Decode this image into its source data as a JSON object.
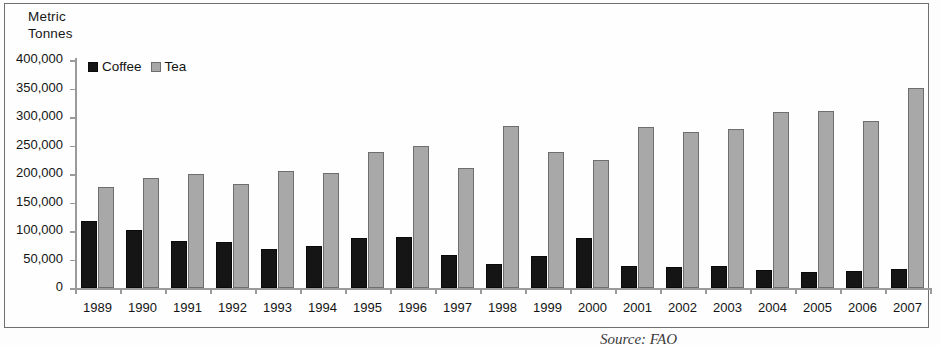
{
  "chart_data": {
    "type": "bar",
    "title": "",
    "axis_title": "Metric\nTonnes",
    "xlabel": "",
    "ylabel": "Metric Tonnes",
    "ylim": [
      0,
      400000
    ],
    "ytick_step": 50000,
    "grid": false,
    "legend_position": "top-left",
    "categories": [
      "1989",
      "1990",
      "1991",
      "1992",
      "1993",
      "1994",
      "1995",
      "1996",
      "1997",
      "1998",
      "1999",
      "2000",
      "2001",
      "2002",
      "2003",
      "2004",
      "2005",
      "2006",
      "2007"
    ],
    "ytick_labels": [
      "400,000",
      "350,000",
      "300,000",
      "250,000",
      "200,000",
      "150,000",
      "100,000",
      "50,000",
      "0"
    ],
    "ytick_values": [
      400000,
      350000,
      300000,
      250000,
      200000,
      150000,
      100000,
      50000,
      0
    ],
    "series": [
      {
        "name": "Coffee",
        "color": "#151515",
        "values": [
          117000,
          102000,
          83000,
          81000,
          69000,
          73000,
          88000,
          89000,
          58000,
          43000,
          56000,
          88000,
          38000,
          37000,
          39000,
          32000,
          28000,
          30000,
          33000
        ]
      },
      {
        "name": "Tea",
        "color": "#a8a8a8",
        "values": [
          178000,
          193000,
          200000,
          183000,
          205000,
          202000,
          238000,
          249000,
          211000,
          285000,
          238000,
          224000,
          282000,
          273000,
          279000,
          309000,
          311000,
          293000,
          351000
        ]
      }
    ]
  },
  "legend": {
    "items": [
      {
        "label": "Coffee",
        "swatch": "coffee-swatch"
      },
      {
        "label": "Tea",
        "swatch": "tea-swatch"
      }
    ]
  },
  "caption": {
    "text": "Source: FAO"
  }
}
